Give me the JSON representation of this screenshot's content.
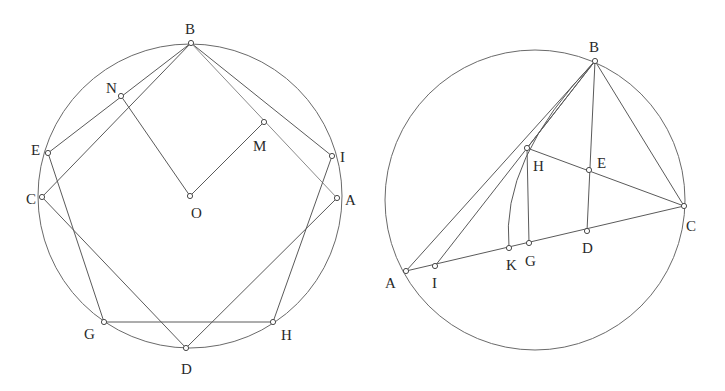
{
  "figures": [
    {
      "id": "left",
      "circle": {
        "cx": 190,
        "cy": 196,
        "r": 152
      },
      "points": {
        "B": {
          "x": 191,
          "y": 43,
          "lx": 185,
          "ly": 34
        },
        "N": {
          "x": 121,
          "y": 96,
          "lx": 106,
          "ly": 93
        },
        "M": {
          "x": 264,
          "y": 122,
          "lx": 253,
          "ly": 151
        },
        "E": {
          "x": 48,
          "y": 153,
          "lx": 31,
          "ly": 155
        },
        "I": {
          "x": 332,
          "y": 156,
          "lx": 340,
          "ly": 162
        },
        "C": {
          "x": 42,
          "y": 197,
          "lx": 26,
          "ly": 204
        },
        "O": {
          "x": 190,
          "y": 196,
          "lx": 191,
          "ly": 218
        },
        "A": {
          "x": 337,
          "y": 198,
          "lx": 345,
          "ly": 205
        },
        "G": {
          "x": 104,
          "y": 322,
          "lx": 84,
          "ly": 339
        },
        "H": {
          "x": 273,
          "y": 322,
          "lx": 281,
          "ly": 340
        },
        "D": {
          "x": 186,
          "y": 348,
          "lx": 181,
          "ly": 374
        }
      },
      "segments": [
        [
          "B",
          "E"
        ],
        [
          "B",
          "C"
        ],
        [
          "B",
          "I"
        ],
        [
          "B",
          "A"
        ],
        [
          "N",
          "O"
        ],
        [
          "O",
          "M"
        ],
        [
          "E",
          "G"
        ],
        [
          "C",
          "D"
        ],
        [
          "A",
          "D"
        ],
        [
          "I",
          "H"
        ],
        [
          "G",
          "H"
        ]
      ],
      "light_segments": [
        [
          "B",
          "A"
        ]
      ]
    },
    {
      "id": "right",
      "circle": {
        "cx": 535,
        "cy": 200,
        "r": 150
      },
      "points": {
        "B": {
          "x": 595,
          "y": 61,
          "lx": 589,
          "ly": 52
        },
        "H": {
          "x": 527,
          "y": 148,
          "lx": 533,
          "ly": 171
        },
        "E": {
          "x": 589,
          "y": 170,
          "lx": 597,
          "ly": 168
        },
        "C": {
          "x": 684,
          "y": 206,
          "lx": 686,
          "ly": 231
        },
        "D": {
          "x": 587,
          "y": 231,
          "lx": 582,
          "ly": 253
        },
        "G": {
          "x": 529,
          "y": 243,
          "lx": 525,
          "ly": 266
        },
        "K": {
          "x": 509,
          "y": 248,
          "lx": 506,
          "ly": 270
        },
        "I": {
          "x": 435,
          "y": 266,
          "lx": 432,
          "ly": 288
        },
        "A": {
          "x": 406,
          "y": 271,
          "lx": 385,
          "ly": 288
        }
      },
      "segments": [
        [
          "A",
          "B"
        ],
        [
          "I",
          "B"
        ],
        [
          "H",
          "B"
        ],
        [
          "H",
          "G"
        ],
        [
          "H",
          "C"
        ],
        [
          "B",
          "D"
        ],
        [
          "B",
          "C"
        ],
        [
          "A",
          "C"
        ]
      ],
      "arc": {
        "from": "K",
        "via": "H",
        "to": "B",
        "path": "M 509 248 Q 500 160 595 61"
      }
    }
  ]
}
